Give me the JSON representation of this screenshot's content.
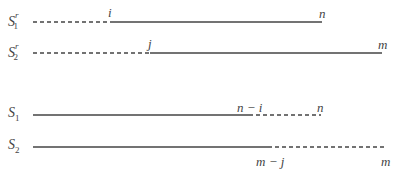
{
  "rows": [
    {
      "name": "S",
      "sub": "1",
      "sup": "r",
      "y": 22,
      "segments": [
        {
          "style": "dashed",
          "x1": 33,
          "x2": 110
        },
        {
          "style": "solid",
          "x1": 110,
          "x2": 322
        }
      ],
      "labels": [
        {
          "text": "i",
          "x": 109,
          "y": 6
        },
        {
          "text": "n",
          "x": 319,
          "y": 6
        }
      ]
    },
    {
      "name": "S",
      "sub": "2",
      "sup": "r",
      "y": 53,
      "segments": [
        {
          "style": "dashed",
          "x1": 33,
          "x2": 150
        },
        {
          "style": "solid",
          "x1": 150,
          "x2": 382
        }
      ],
      "labels": [
        {
          "text": "j",
          "x": 149,
          "y": 37
        },
        {
          "text": "m",
          "x": 378,
          "y": 37
        }
      ]
    },
    {
      "name": "S",
      "sub": "1",
      "sup": "",
      "y": 115,
      "segments": [
        {
          "style": "solid",
          "x1": 33,
          "x2": 249
        },
        {
          "style": "dashed",
          "x1": 249,
          "x2": 321
        }
      ],
      "labels": [
        {
          "text": "n − i",
          "x": 237,
          "y": 100
        },
        {
          "text": "n",
          "x": 317,
          "y": 100
        }
      ]
    },
    {
      "name": "S",
      "sub": "2",
      "sup": "",
      "y": 147,
      "segments": [
        {
          "style": "solid",
          "x1": 33,
          "x2": 268
        },
        {
          "style": "dashed",
          "x1": 268,
          "x2": 386
        }
      ],
      "labels": [
        {
          "text": "m − j",
          "x": 256,
          "y": 155
        },
        {
          "text": "m",
          "x": 381,
          "y": 155
        }
      ]
    }
  ],
  "text": {
    "row0_name": "S",
    "row0_sub": "1",
    "row0_sup": "r",
    "row1_name": "S",
    "row1_sub": "2",
    "row1_sup": "r",
    "row2_name": "S",
    "row2_sub": "1",
    "row3_name": "S",
    "row3_sub": "2",
    "l_i": "i",
    "l_n1": "n",
    "l_j": "j",
    "l_m1": "m",
    "l_ni": "n − i",
    "l_n2": "n",
    "l_mj": "m − j",
    "l_m2": "m"
  }
}
